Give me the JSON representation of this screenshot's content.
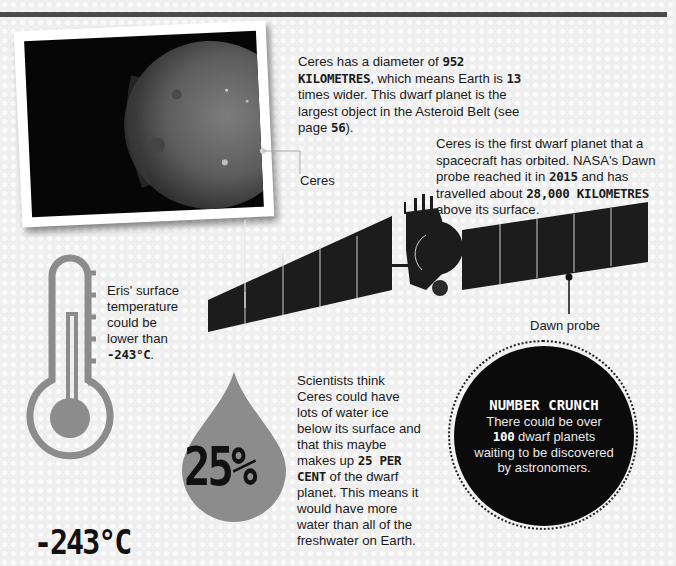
{
  "ceres_photo": {
    "label": "Ceres",
    "alt": "Photograph of dwarf planet Ceres"
  },
  "ceres_fact": {
    "part1": "Ceres has a diameter of ",
    "hl1": "952 KILOMETRES",
    "part2": ", which means Earth is ",
    "hl2": "13",
    "part3": " times wider. This dwarf planet is the largest object in the Asteroid Belt (see page ",
    "hl3": "56",
    "part4": ")."
  },
  "dawn_fact": {
    "part1": "Ceres is the first dwarf planet that a spacecraft has orbited. NASA's Dawn probe reached it in ",
    "hl1": "2015",
    "part2": " and has travelled about ",
    "hl2": "28,000 KILOMETRES",
    "part3": " above its surface."
  },
  "dawn_probe": {
    "label": "Dawn probe"
  },
  "eris_fact": {
    "part1": "Eris' surface temperature could be lower than ",
    "hl1": "-243°C",
    "part2": "."
  },
  "thermometer": {
    "value_label": "-243°C"
  },
  "water_drop": {
    "value_label": "25%"
  },
  "water_fact": {
    "part1": "Scientists think Ceres could have lots of water ice below its surface and that this maybe makes up ",
    "hl1": "25 PER CENT",
    "part2": " of the dwarf planet. This means it would have more water than all of the freshwater on Earth."
  },
  "number_crunch": {
    "title": "NUMBER CRUNCH",
    "part1": "There could be over ",
    "hl1": "100",
    "part2": " dwarf planets waiting to be discovered by astronomers."
  },
  "colors": {
    "background": "#efefef",
    "topbar": "#4a4a4a",
    "icon_grey": "#8c8c8c",
    "dark": "#0b0b0b"
  }
}
